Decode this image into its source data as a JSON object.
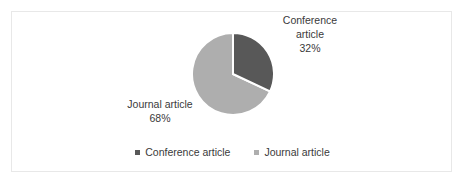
{
  "figure": {
    "background_color": "#ffffff",
    "frame_color": "#e8e8e8",
    "text_color": "#3a3a3a"
  },
  "chart_data": {
    "type": "pie",
    "title": "",
    "subtitle": "",
    "xlabel": "",
    "ylabel": "",
    "grid": false,
    "legend_position": "bottom",
    "start_angle_deg": 0,
    "direction": "clockwise",
    "categories": [
      "Conference article",
      "Journal article"
    ],
    "values": [
      32,
      68
    ],
    "value_unit": "%",
    "colors": [
      "#585858",
      "#aeaeae"
    ],
    "slices": [
      {
        "label": "Conference article",
        "value": 32,
        "value_label": "32%",
        "color": "#585858",
        "label_line1": "Conference",
        "label_line2": "article",
        "start_angle_deg": 0,
        "end_angle_deg": 115.2
      },
      {
        "label": "Journal article",
        "value": 68,
        "value_label": "68%",
        "color": "#aeaeae",
        "label_line1": "Journal article",
        "label_line2": "",
        "start_angle_deg": 115.2,
        "end_angle_deg": 360
      }
    ],
    "annotations": [
      {
        "text": "Conference article",
        "value": "32%"
      },
      {
        "text": "Journal article",
        "value": "68%"
      }
    ],
    "legend": [
      {
        "label": "Conference article",
        "color": "#585858",
        "marker": "square-marker"
      },
      {
        "label": "Journal article",
        "color": "#aeaeae",
        "marker": "square-marker"
      }
    ]
  }
}
